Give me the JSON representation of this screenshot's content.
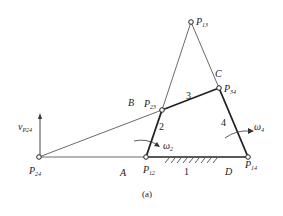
{
  "diagram": {
    "caption": "(a)",
    "points": {
      "p13": {
        "label": "P",
        "sub": "13"
      },
      "p34": {
        "label": "P",
        "sub": "34"
      },
      "p23": {
        "label": "P",
        "sub": "23"
      },
      "p12": {
        "label": "P",
        "sub": "12"
      },
      "p14": {
        "label": "P",
        "sub": "14"
      },
      "p24": {
        "label": "P",
        "sub": "24"
      }
    },
    "joints": {
      "A": "A",
      "B": "B",
      "C": "C",
      "D": "D"
    },
    "links": {
      "l1": "1",
      "l2": "2",
      "l3": "3",
      "l4": "4"
    },
    "angular_velocities": {
      "w2": {
        "label": "ω",
        "sub": "2"
      },
      "w4": {
        "label": "ω",
        "sub": "4"
      }
    },
    "velocity": {
      "label": "v",
      "sub": "P24"
    },
    "colors": {
      "line": "#333333",
      "text": "#222222"
    }
  }
}
